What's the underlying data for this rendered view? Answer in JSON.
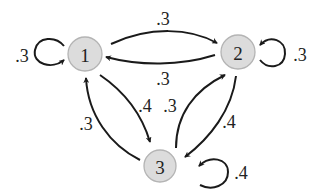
{
  "diagram": {
    "type": "markov-chain-state-diagram",
    "nodes": [
      {
        "id": "1",
        "label": "1",
        "cx": 85,
        "cy": 54,
        "r": 17
      },
      {
        "id": "2",
        "label": "2",
        "cx": 238,
        "cy": 52,
        "r": 17
      },
      {
        "id": "3",
        "label": "3",
        "cx": 160,
        "cy": 166,
        "r": 16
      }
    ],
    "edges": [
      {
        "from": "1",
        "to": "1",
        "label": ".3"
      },
      {
        "from": "1",
        "to": "2",
        "label": ".3"
      },
      {
        "from": "2",
        "to": "1",
        "label": ".3"
      },
      {
        "from": "2",
        "to": "2",
        "label": ".3"
      },
      {
        "from": "1",
        "to": "3",
        "label": ".4"
      },
      {
        "from": "3",
        "to": "1",
        "label": ".3"
      },
      {
        "from": "3",
        "to": "2",
        "label": ".3"
      },
      {
        "from": "2",
        "to": "3",
        "label": ".4"
      },
      {
        "from": "3",
        "to": "3",
        "label": ".4"
      }
    ],
    "colors": {
      "node_fill": "#dcdcdc",
      "node_stroke": "#b4b4b4",
      "edge": "#1a1a1a",
      "text": "#222222",
      "background": "#ffffff"
    }
  }
}
